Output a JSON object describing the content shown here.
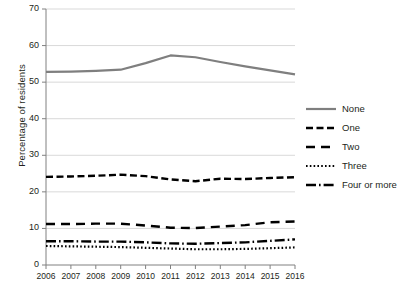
{
  "chart_data": {
    "type": "line",
    "title": "",
    "xlabel": "",
    "ylabel": "Percentage of residents",
    "x": [
      2006,
      2007,
      2008,
      2009,
      2010,
      2011,
      2012,
      2013,
      2014,
      2015,
      2016
    ],
    "categories": [
      "2006",
      "2007",
      "2008",
      "2009",
      "2010",
      "2011",
      "2012",
      "2013",
      "2014",
      "2015",
      "2016"
    ],
    "ylim": [
      0,
      70
    ],
    "yticks": [
      0,
      10,
      20,
      30,
      40,
      50,
      60,
      70
    ],
    "ytick_labels": [
      "0",
      "10",
      "20",
      "30",
      "40",
      "50",
      "60",
      "70"
    ],
    "grid": true,
    "legend_position": "right",
    "series": [
      {
        "name": "None",
        "style": "solid",
        "color": "#7f7f7f",
        "values": [
          52.8,
          52.9,
          53.1,
          53.4,
          55.2,
          57.3,
          56.8,
          55.5,
          54.3,
          53.2,
          52.1
        ]
      },
      {
        "name": "One",
        "style": "dashed",
        "color": "#000000",
        "values": [
          24.1,
          24.2,
          24.4,
          24.7,
          24.3,
          23.4,
          22.9,
          23.6,
          23.5,
          23.8,
          24.0
        ]
      },
      {
        "name": "Two",
        "style": "long-dash",
        "color": "#000000",
        "values": [
          11.2,
          11.2,
          11.3,
          11.3,
          10.8,
          10.2,
          10.1,
          10.5,
          10.9,
          11.7,
          11.9
        ]
      },
      {
        "name": "Three",
        "style": "dotted",
        "color": "#000000",
        "values": [
          5.2,
          5.1,
          5.0,
          4.9,
          4.7,
          4.5,
          4.3,
          4.3,
          4.4,
          4.6,
          4.8
        ]
      },
      {
        "name": "Four or more",
        "style": "dash-dot",
        "color": "#000000",
        "values": [
          6.5,
          6.5,
          6.4,
          6.4,
          6.2,
          5.9,
          5.8,
          6.0,
          6.2,
          6.6,
          7.0
        ]
      }
    ]
  },
  "legend": {
    "items": [
      {
        "label": "None"
      },
      {
        "label": "One"
      },
      {
        "label": "Two"
      },
      {
        "label": "Three"
      },
      {
        "label": "Four or more"
      }
    ]
  }
}
